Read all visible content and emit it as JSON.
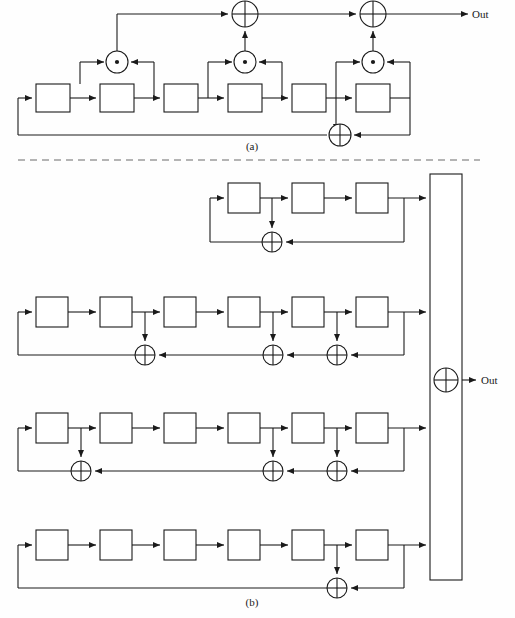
{
  "figure": {
    "background_color": "#fefefe",
    "line_color": "#1a1a1a",
    "separator_color": "#6b6b6b",
    "width": 515,
    "height": 618
  },
  "panels": [
    {
      "id": "a",
      "caption": "(a)",
      "caption_position": {
        "x": 252,
        "y": 148
      },
      "description": "Single linear feedback shift register with nonlinear filter taps",
      "output_label": "Out",
      "output_label_position": {
        "x": 476,
        "y": 19
      },
      "register_count": 6,
      "registers": [
        {
          "index": 1,
          "x": 36,
          "y": 84,
          "w": 34,
          "h": 28
        },
        {
          "index": 2,
          "x": 100,
          "y": 84,
          "w": 34,
          "h": 28
        },
        {
          "index": 3,
          "x": 164,
          "y": 84,
          "w": 34,
          "h": 28
        },
        {
          "index": 4,
          "x": 228,
          "y": 84,
          "w": 34,
          "h": 28
        },
        {
          "index": 5,
          "x": 292,
          "y": 84,
          "w": 34,
          "h": 28
        },
        {
          "index": 6,
          "x": 356,
          "y": 84,
          "w": 34,
          "h": 28
        }
      ],
      "and_gates": [
        {
          "index": 1,
          "symbol": "dot",
          "cx": 117,
          "cy": 62,
          "r": 11
        },
        {
          "index": 2,
          "symbol": "dot",
          "cx": 245,
          "cy": 62,
          "r": 11
        },
        {
          "index": 3,
          "symbol": "dot",
          "cx": 373,
          "cy": 62,
          "r": 11
        }
      ],
      "xor_gates": [
        {
          "index": 1,
          "symbol": "plus",
          "cx": 245,
          "cy": 14,
          "r": 13,
          "role": "output-chain"
        },
        {
          "index": 2,
          "symbol": "plus",
          "cx": 373,
          "cy": 14,
          "r": 13,
          "role": "output-chain"
        },
        {
          "index": 3,
          "symbol": "plus",
          "cx": 340,
          "cy": 135,
          "r": 11,
          "role": "feedback"
        }
      ]
    },
    {
      "id": "b",
      "caption": "(b)",
      "caption_position": {
        "x": 252,
        "y": 603
      },
      "description": "Four linear feedback shift registers feeding a nonlinear combining function",
      "output_label": "Out",
      "output_label_position": {
        "x": 481,
        "y": 384
      },
      "combiner": {
        "name": "combining-function-block",
        "x": 430,
        "y": 174,
        "w": 32,
        "h": 406,
        "xor": {
          "symbol": "plus",
          "cx": 446,
          "cy": 380,
          "r": 12
        }
      },
      "lfsrs": [
        {
          "index": 1,
          "register_count": 3,
          "length": 3,
          "tap_positions": [
            1
          ],
          "y_top": 183,
          "registers": [
            {
              "index": 1,
              "x": 228,
              "y": 183,
              "w": 32,
              "h": 30
            },
            {
              "index": 2,
              "x": 292,
              "y": 183,
              "w": 32,
              "h": 30
            },
            {
              "index": 3,
              "x": 356,
              "y": 183,
              "w": 32,
              "h": 30
            }
          ],
          "xor_gates": [
            {
              "cx": 272,
              "cy": 242,
              "r": 10
            }
          ]
        },
        {
          "index": 2,
          "register_count": 6,
          "length": 6,
          "tap_positions": [
            2,
            4,
            5
          ],
          "y_top": 297,
          "registers": [
            {
              "index": 1,
              "x": 36,
              "y": 297,
              "w": 32,
              "h": 30
            },
            {
              "index": 2,
              "x": 100,
              "y": 297,
              "w": 32,
              "h": 30
            },
            {
              "index": 3,
              "x": 164,
              "y": 297,
              "w": 32,
              "h": 30
            },
            {
              "index": 4,
              "x": 228,
              "y": 297,
              "w": 32,
              "h": 30
            },
            {
              "index": 5,
              "x": 292,
              "y": 297,
              "w": 32,
              "h": 30
            },
            {
              "index": 6,
              "x": 356,
              "y": 297,
              "w": 32,
              "h": 30
            }
          ],
          "xor_gates": [
            {
              "cx": 145,
              "cy": 355,
              "r": 10
            },
            {
              "cx": 273,
              "cy": 355,
              "r": 10
            },
            {
              "cx": 337,
              "cy": 355,
              "r": 10
            }
          ]
        },
        {
          "index": 3,
          "register_count": 6,
          "length": 6,
          "tap_positions": [
            1,
            4,
            5
          ],
          "y_top": 413,
          "registers": [
            {
              "index": 1,
              "x": 36,
              "y": 413,
              "w": 32,
              "h": 30
            },
            {
              "index": 2,
              "x": 100,
              "y": 413,
              "w": 32,
              "h": 30
            },
            {
              "index": 3,
              "x": 164,
              "y": 413,
              "w": 32,
              "h": 30
            },
            {
              "index": 4,
              "x": 228,
              "y": 413,
              "w": 32,
              "h": 30
            },
            {
              "index": 5,
              "x": 292,
              "y": 413,
              "w": 32,
              "h": 30
            },
            {
              "index": 6,
              "x": 356,
              "y": 413,
              "w": 32,
              "h": 30
            }
          ],
          "xor_gates": [
            {
              "cx": 81,
              "cy": 471,
              "r": 10
            },
            {
              "cx": 273,
              "cy": 471,
              "r": 10
            },
            {
              "cx": 337,
              "cy": 471,
              "r": 10
            }
          ]
        },
        {
          "index": 4,
          "register_count": 6,
          "length": 6,
          "tap_positions": [
            5
          ],
          "y_top": 530,
          "registers": [
            {
              "index": 1,
              "x": 36,
              "y": 530,
              "w": 32,
              "h": 30
            },
            {
              "index": 2,
              "x": 100,
              "y": 530,
              "w": 32,
              "h": 30
            },
            {
              "index": 3,
              "x": 164,
              "y": 530,
              "w": 32,
              "h": 30
            },
            {
              "index": 4,
              "x": 228,
              "y": 530,
              "w": 32,
              "h": 30
            },
            {
              "index": 5,
              "x": 292,
              "y": 530,
              "w": 32,
              "h": 30
            },
            {
              "index": 6,
              "x": 356,
              "y": 530,
              "w": 32,
              "h": 30
            }
          ],
          "xor_gates": [
            {
              "cx": 337,
              "cy": 588,
              "r": 10
            }
          ]
        }
      ]
    }
  ],
  "separator": {
    "name": "panel-separator",
    "y": 160,
    "x1": 18,
    "x2": 480
  },
  "symbols": {
    "xor": "⊕",
    "and": "⊙",
    "arrow": "▶"
  }
}
